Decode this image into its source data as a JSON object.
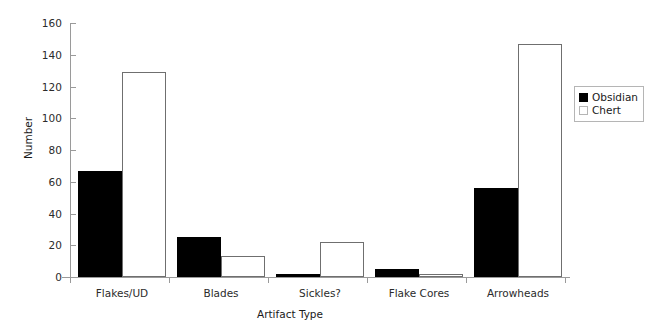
{
  "chart_data": {
    "type": "bar",
    "title": "",
    "xlabel": "Artifact Type",
    "ylabel": "Number",
    "categories": [
      "Flakes/UD",
      "Blades",
      "Sickles?",
      "Flake Cores",
      "Arrowheads"
    ],
    "series": [
      {
        "name": "Obsidian",
        "color": "#000000",
        "values": [
          67,
          25,
          2,
          5,
          56
        ]
      },
      {
        "name": "Chert",
        "color": "#ffffff",
        "values": [
          129,
          13,
          22,
          2,
          147
        ]
      }
    ],
    "ylim": [
      0,
      160
    ],
    "yticks": [
      0,
      20,
      40,
      60,
      80,
      100,
      120,
      140,
      160
    ],
    "ytick_labels": [
      "0",
      "20",
      "40",
      "60",
      "80",
      "100",
      "120",
      "140",
      "160"
    ],
    "grid": false,
    "legend_position": "right"
  },
  "legend": {
    "entries": [
      {
        "label": "Obsidian",
        "swatch": "filled-black"
      },
      {
        "label": "Chert",
        "swatch": "outlined-white"
      }
    ]
  },
  "axes": {
    "y_title": "Number",
    "x_title": "Artifact Type"
  }
}
